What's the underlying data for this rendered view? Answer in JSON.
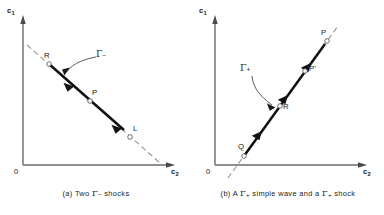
{
  "figure": {
    "panels": [
      {
        "id": "a",
        "caption_prefix": "(a) Two ",
        "caption_gamma": "Γ",
        "caption_sub": "−",
        "caption_suffix": " shocks",
        "axes": {
          "yaxis_label": "c",
          "yaxis_sub": "1",
          "xaxis_label": "c",
          "xaxis_sub": "2",
          "origin_label": "0"
        },
        "curve_label": {
          "gamma": "Γ",
          "sub": "−"
        },
        "points": [
          {
            "name": "R",
            "label": "R"
          },
          {
            "name": "P",
            "label": "P"
          },
          {
            "name": "L",
            "label": "L"
          }
        ]
      },
      {
        "id": "b",
        "caption_prefix": "(b) A ",
        "caption_gamma": "Γ",
        "caption_sub": "+",
        "caption_mid": " simple wave and a ",
        "caption_gamma2": "Γ",
        "caption_sub2": "+",
        "caption_suffix": " shock",
        "axes": {
          "yaxis_label": "c",
          "yaxis_sub": "1",
          "xaxis_label": "c",
          "xaxis_sub": "2",
          "origin_label": "0"
        },
        "curve_label": {
          "gamma": "Γ",
          "sub": "+"
        },
        "points": [
          {
            "name": "P",
            "label": "P"
          },
          {
            "name": "P-prime",
            "label": "P'"
          },
          {
            "name": "R",
            "label": "R"
          },
          {
            "name": "Q",
            "label": "Q"
          }
        ]
      }
    ],
    "colors": {
      "ink": "#1a1a1a",
      "axis": "#6b6b6b",
      "dashed": "#8a8a8a",
      "thick": "#111111",
      "marker_stroke": "#555555"
    }
  }
}
